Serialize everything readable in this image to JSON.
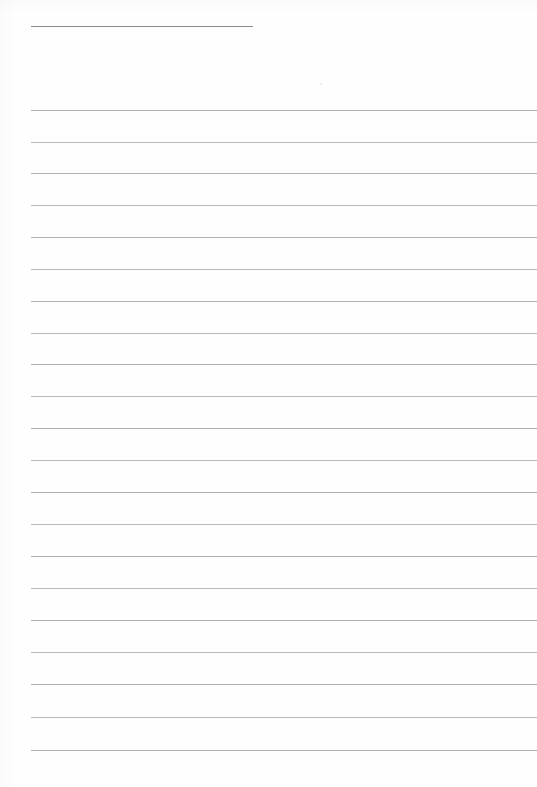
{
  "document": {
    "kind": "ruled-paper-sheet",
    "title": "",
    "page_width": 537,
    "page_height": 787,
    "background_color": "#fefefe",
    "rule_color": "#a3a3a8",
    "heading_rule_color": "#8b8b90",
    "text_content": "",
    "visible_text_count": 0
  },
  "heading_rule": {
    "label": "title-rule",
    "x": 31,
    "y": 26,
    "width": 222,
    "thickness": 1
  },
  "body_rules": {
    "left_margin": 31,
    "right_edge": 537,
    "first_line_y": 110,
    "line_spacing": 32,
    "count": 21,
    "lines": [
      {
        "index": 1,
        "y": 110,
        "x": 31,
        "width": 506
      },
      {
        "index": 2,
        "y": 142,
        "x": 31,
        "width": 506
      },
      {
        "index": 3,
        "y": 173,
        "x": 31,
        "width": 506
      },
      {
        "index": 4,
        "y": 205,
        "x": 31,
        "width": 506
      },
      {
        "index": 5,
        "y": 237,
        "x": 31,
        "width": 506
      },
      {
        "index": 6,
        "y": 269,
        "x": 31,
        "width": 506
      },
      {
        "index": 7,
        "y": 301,
        "x": 31,
        "width": 506
      },
      {
        "index": 8,
        "y": 333,
        "x": 31,
        "width": 506
      },
      {
        "index": 9,
        "y": 364,
        "x": 31,
        "width": 506
      },
      {
        "index": 10,
        "y": 396,
        "x": 31,
        "width": 506
      },
      {
        "index": 11,
        "y": 428,
        "x": 31,
        "width": 506
      },
      {
        "index": 12,
        "y": 460,
        "x": 31,
        "width": 506
      },
      {
        "index": 13,
        "y": 492,
        "x": 31,
        "width": 506
      },
      {
        "index": 14,
        "y": 524,
        "x": 31,
        "width": 506
      },
      {
        "index": 15,
        "y": 556,
        "x": 31,
        "width": 506
      },
      {
        "index": 16,
        "y": 588,
        "x": 31,
        "width": 506
      },
      {
        "index": 17,
        "y": 620,
        "x": 31,
        "width": 506
      },
      {
        "index": 18,
        "y": 652,
        "x": 31,
        "width": 506
      },
      {
        "index": 19,
        "y": 684,
        "x": 31,
        "width": 506
      },
      {
        "index": 20,
        "y": 717,
        "x": 31,
        "width": 506
      },
      {
        "index": 21,
        "y": 750,
        "x": 31,
        "width": 506
      }
    ]
  },
  "artifacts": {
    "specks": [
      {
        "x": 320,
        "y": 83
      }
    ]
  }
}
